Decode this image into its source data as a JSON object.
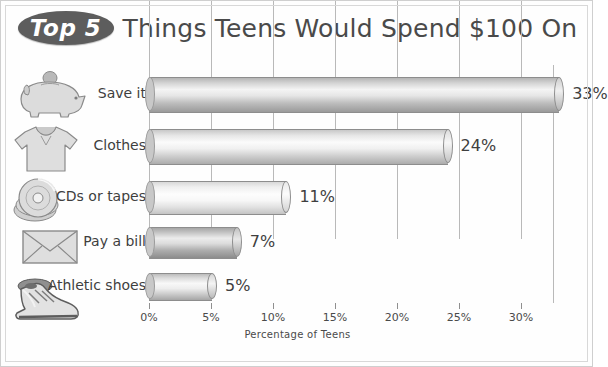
{
  "title": {
    "badge": "Top 5",
    "text": "Things Teens Would Spend $100 On"
  },
  "axis": {
    "xlabel": "Percentage of Teens",
    "ticks": [
      "0%",
      "5%",
      "10%",
      "15%",
      "20%",
      "25%",
      "30%"
    ]
  },
  "rows": [
    {
      "label": "Save it",
      "value_label": "33%",
      "icon": "piggy-bank-icon"
    },
    {
      "label": "Clothes",
      "value_label": "24%",
      "icon": "tshirt-icon"
    },
    {
      "label": "CDs or tapes",
      "value_label": "11%",
      "icon": "compact-disc-icon"
    },
    {
      "label": "Pay a bill",
      "value_label": "7%",
      "icon": "envelope-icon"
    },
    {
      "label": "Athletic shoes",
      "value_label": "5%",
      "icon": "sneaker-icon"
    }
  ],
  "chart_data": {
    "type": "bar",
    "orientation": "horizontal",
    "title": "Top 5 Things Teens Would Spend $100 On",
    "categories": [
      "Save it",
      "Clothes",
      "CDs or tapes",
      "Pay a bill",
      "Athletic shoes"
    ],
    "values": [
      33,
      24,
      11,
      7,
      5
    ],
    "data_labels": [
      "33%",
      "24%",
      "11%",
      "7%",
      "5%"
    ],
    "xlabel": "Percentage of Teens",
    "ylabel": "",
    "xlim": [
      0,
      32.6
    ],
    "xticks": [
      0,
      5,
      10,
      15,
      20,
      25,
      30
    ],
    "xticklabels": [
      "0%",
      "5%",
      "10%",
      "15%",
      "20%",
      "25%",
      "30%"
    ],
    "grid": "vertical-only",
    "legend": "none",
    "units": "percent",
    "bar_style": "3d-cylinder-grayscale"
  },
  "colors": {
    "badge_fill": "#5d5d5d",
    "badge_text": "#ffffff",
    "title_text": "#4a4a4a",
    "label_text": "#3f3f3f",
    "gridline": "#b9b9b9",
    "frame_border": "#cfcfcf",
    "background": "#ffffff"
  }
}
